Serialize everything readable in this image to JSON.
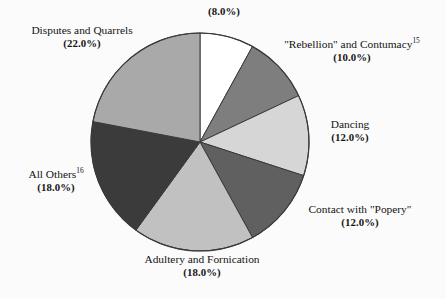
{
  "cropped_header_text": "",
  "chart_data": {
    "type": "pie",
    "title": "",
    "xlabel": "",
    "ylabel": "",
    "legend_position": "labels-around-slices",
    "grid": false,
    "total": 100.0,
    "units": "percent",
    "start_angle_deg": 0,
    "direction": "clockwise",
    "categories": [
      "",
      "\"Rebellion\" and Contumacy",
      "Dancing",
      "Contact with \"Popery\"",
      "Adultery and Fornication",
      "All Others",
      "Disputes and Quarrels"
    ],
    "values": [
      8.0,
      10.0,
      12.0,
      12.0,
      18.0,
      18.0,
      22.0
    ],
    "slices": [
      {
        "name": "",
        "name_footnote": "",
        "value": 8.0,
        "value_label": "(8.0%)",
        "color": "#ffffff"
      },
      {
        "name": "\"Rebellion\" and Contumacy",
        "name_footnote": "15",
        "value": 10.0,
        "value_label": "(10.0%)",
        "color": "#7e7e7e"
      },
      {
        "name": "Dancing",
        "name_footnote": "",
        "value": 12.0,
        "value_label": "(12.0%)",
        "color": "#d6d6d6"
      },
      {
        "name": "Contact with \"Popery\"",
        "name_footnote": "",
        "value": 12.0,
        "value_label": "(12.0%)",
        "color": "#606060"
      },
      {
        "name": "Adultery and Fornication",
        "name_footnote": "",
        "value": 18.0,
        "value_label": "(18.0%)",
        "color": "#c1c1c1"
      },
      {
        "name": "All Others",
        "name_footnote": "16",
        "value": 18.0,
        "value_label": "(18.0%)",
        "color": "#3b3b3b"
      },
      {
        "name": "Disputes and Quarrels",
        "name_footnote": "",
        "value": 22.0,
        "value_label": "(22.0%)",
        "color": "#a9a9a9"
      }
    ],
    "colors": {
      "outline": "#3a3a3a",
      "background": "#fbfbfb",
      "text": "#141414"
    }
  }
}
